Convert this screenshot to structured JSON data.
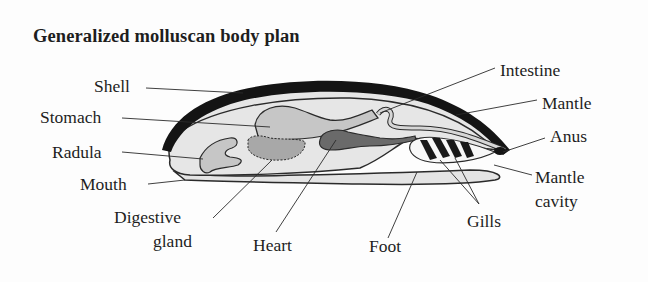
{
  "title": "Generalized molluscan body plan",
  "labels": {
    "shell": "Shell",
    "stomach": "Stomach",
    "radula": "Radula",
    "mouth": "Mouth",
    "digestive_gland_1": "Digestive",
    "digestive_gland_2": "gland",
    "heart": "Heart",
    "foot": "Foot",
    "gills": "Gills",
    "mantle_cavity_1": "Mantle",
    "mantle_cavity_2": "cavity",
    "anus": "Anus",
    "mantle": "Mantle",
    "intestine": "Intestine"
  },
  "colors": {
    "shell": "#141414",
    "body": "#e4e4e4",
    "organ": "#c4c4c4",
    "heart": "#6a6a6a",
    "outline": "#2a2a2a"
  }
}
